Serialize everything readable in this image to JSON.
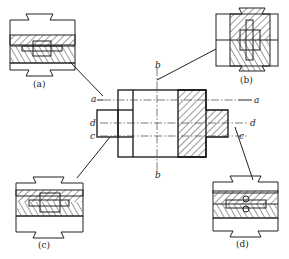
{
  "figure": {
    "center_labels": {
      "a_left": "a",
      "a_right": "a",
      "b_top": "b",
      "b_bottom": "b",
      "c_left": "c",
      "c_right": "c",
      "d_left": "d",
      "d_right": "d"
    },
    "insets": [
      {
        "id": "a",
        "caption": "(a)"
      },
      {
        "id": "b",
        "caption": "(b)"
      },
      {
        "id": "c",
        "caption": "(c)"
      },
      {
        "id": "d",
        "caption": "(d)"
      }
    ]
  }
}
